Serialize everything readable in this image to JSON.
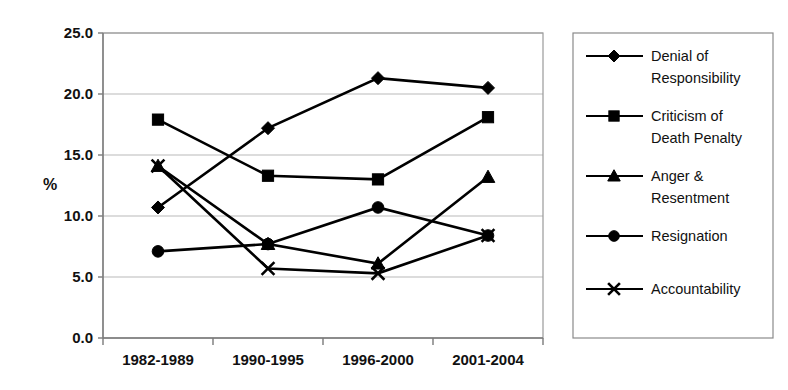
{
  "chart_data": {
    "type": "line",
    "title": "",
    "xlabel": "",
    "ylabel": "%",
    "categories": [
      "1982-1989",
      "1990-1995",
      "1996-2000",
      "2001-2004"
    ],
    "ylim": [
      0.0,
      25.0
    ],
    "ytick_step": 5.0,
    "ytick_labels": [
      "0.0",
      "5.0",
      "10.0",
      "15.0",
      "20.0",
      "25.0"
    ],
    "grid": true,
    "legend_position": "right",
    "series": [
      {
        "name": "Denial of Responsibility",
        "marker": "diamond",
        "values": [
          10.7,
          17.2,
          21.3,
          20.5
        ]
      },
      {
        "name": "Criticism of Death Penalty",
        "marker": "square",
        "values": [
          17.9,
          13.3,
          13.0,
          18.1
        ]
      },
      {
        "name": "Anger & Resentment",
        "marker": "triangle",
        "values": [
          14.1,
          7.7,
          6.1,
          13.2
        ]
      },
      {
        "name": "Resignation",
        "marker": "circle",
        "values": [
          7.1,
          7.7,
          10.7,
          8.4
        ]
      },
      {
        "name": "Accountability",
        "marker": "cross",
        "values": [
          14.1,
          5.7,
          5.3,
          8.4
        ]
      }
    ]
  },
  "legend": {
    "entries": [
      {
        "label_line1": "Denial of",
        "label_line2": "Responsibility",
        "marker": "diamond"
      },
      {
        "label_line1": "Criticism of",
        "label_line2": "Death Penalty",
        "marker": "square"
      },
      {
        "label_line1": "Anger &",
        "label_line2": "Resentment",
        "marker": "triangle"
      },
      {
        "label_line1": "Resignation",
        "label_line2": "",
        "marker": "circle"
      },
      {
        "label_line1": "Accountability",
        "label_line2": "",
        "marker": "cross"
      }
    ]
  },
  "colors": {
    "series": "#000000",
    "grid": "#b9b9b9",
    "axis": "#7a7a7a",
    "background": "#ffffff"
  }
}
